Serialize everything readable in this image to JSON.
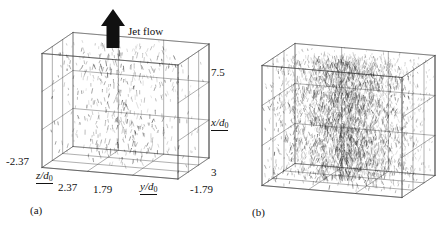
{
  "figure": {
    "type": "3d-vector-field-pair",
    "background": "#ffffff",
    "line_color": "#4a4a4a",
    "vector_color": "#222222"
  },
  "annotations": {
    "jet_flow_label": "Jet flow",
    "jet_flow_arrow": "up-arrow-icon"
  },
  "panels": [
    {
      "id": "a",
      "tag": "(a)",
      "density": "sparse",
      "vector_count": 520,
      "axes": {
        "x": {
          "label": "x/d",
          "label_sub": "0",
          "min": 3,
          "max": 7.5,
          "min_text": "3",
          "max_text": "7.5",
          "divisions": 3
        },
        "y": {
          "label": "y/d",
          "label_sub": "0",
          "min": -1.79,
          "max": 1.79,
          "min_text": "-1.79",
          "max_text": "1.79",
          "divisions": 3
        },
        "z": {
          "label": "z/d",
          "label_sub": "0",
          "min": -2.37,
          "max": 2.37,
          "min_text": "-2.37",
          "max_text": "2.37",
          "divisions": 3
        }
      }
    },
    {
      "id": "b",
      "tag": "(b)",
      "density": "dense",
      "vector_count": 3400,
      "axes": {
        "x": {
          "label": "x/d",
          "label_sub": "0",
          "min": 3,
          "max": 7.5,
          "divisions": 3
        },
        "y": {
          "label": "y/d",
          "label_sub": "0",
          "min": -1.79,
          "max": 1.79,
          "divisions": 3
        },
        "z": {
          "label": "z/d",
          "label_sub": "0",
          "min": -2.37,
          "max": 2.37,
          "divisions": 3
        }
      }
    }
  ],
  "chart_data": {
    "type": "scatter",
    "title": "",
    "xlabel": "y/d0",
    "ylabel": "x/d0",
    "zlabel": "z/d0",
    "xlim": [
      1.79,
      -1.79
    ],
    "ylim": [
      3,
      7.5
    ],
    "zlim": [
      -2.37,
      2.37
    ],
    "grid": true,
    "legend": null,
    "series": [
      {
        "name": "panel-a-vectors",
        "density": "sparse",
        "count": 520,
        "orientation": "predominantly-vertical"
      },
      {
        "name": "panel-b-vectors",
        "density": "dense",
        "count": 3400,
        "orientation": "predominantly-vertical"
      }
    ],
    "tick_labels": {
      "x_axis": [
        "7.5",
        "3"
      ],
      "y_axis": [
        "1.79",
        "-1.79"
      ],
      "z_axis": [
        "-2.37",
        "2.37"
      ]
    }
  }
}
